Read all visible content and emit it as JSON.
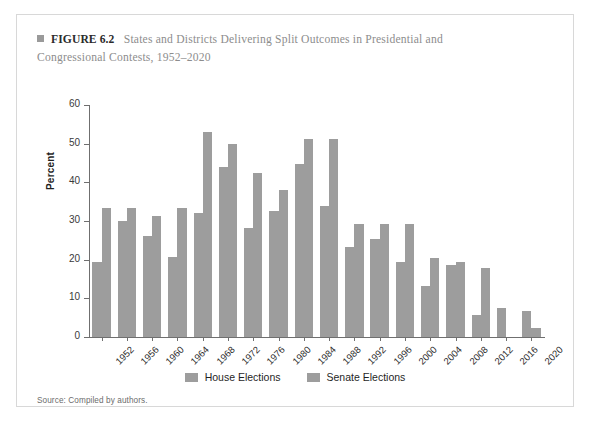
{
  "figure": {
    "marker_icon": "square-bullet-icon",
    "label": "FIGURE 6.2",
    "caption_line1": "States and Districts Delivering Split Outcomes in Presidential and",
    "caption_line2": "Congressional Contests, 1952–2020"
  },
  "source": {
    "text": "Source: Compiled by authors."
  },
  "legend": {
    "items": [
      {
        "label": "House Elections",
        "color": "#9d9d9d"
      },
      {
        "label": "Senate Elections",
        "color": "#9d9d9d"
      }
    ]
  },
  "chart_data": {
    "type": "bar",
    "title": "States and Districts Delivering Split Outcomes in Presidential and Congressional Contests, 1952–2020",
    "xlabel": "",
    "ylabel": "Percent",
    "ylim": [
      0,
      60
    ],
    "yticks": [
      0,
      10,
      20,
      30,
      40,
      50,
      60
    ],
    "ytick_labels": [
      "0",
      "10",
      "20",
      "30",
      "40",
      "50",
      "60"
    ],
    "grid": false,
    "legend_position": "bottom",
    "bar_color": "#9d9d9d",
    "categories": [
      "1952",
      "1956",
      "1960",
      "1964",
      "1968",
      "1972",
      "1976",
      "1980",
      "1984",
      "1988",
      "1992",
      "1996",
      "2000",
      "2004",
      "2008",
      "2012",
      "2016",
      "2020"
    ],
    "series": [
      {
        "name": "House Elections",
        "values": [
          19.3,
          29.9,
          26.1,
          20.7,
          32.0,
          44.0,
          28.3,
          32.6,
          44.8,
          33.8,
          23.4,
          25.3,
          19.3,
          13.2,
          18.6,
          5.7,
          7.6,
          6.7
        ]
      },
      {
        "name": "Senate Elections",
        "values": [
          33.3,
          33.3,
          31.2,
          33.3,
          53.0,
          49.8,
          42.3,
          38.0,
          51.3,
          51.3,
          29.2,
          29.2,
          29.2,
          20.4,
          19.5,
          17.8,
          null,
          2.3
        ]
      }
    ]
  }
}
